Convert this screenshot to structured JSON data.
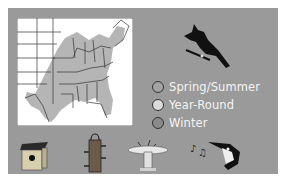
{
  "figure": {
    "map": {
      "name": "range-map",
      "region": "Eastern United States",
      "range_color": "#b5b5b5",
      "border_color": "#333333"
    },
    "bird": {
      "name": "cardinal-silhouette",
      "color": "#111111"
    },
    "legend": {
      "items": [
        {
          "label": "Spring/Summer",
          "color": "#a3a3a3"
        },
        {
          "label": "Year-Round",
          "color": "#dcdcdc"
        },
        {
          "label": "Winter",
          "color": "#8a8a8a"
        }
      ]
    },
    "habitat_icons": [
      {
        "name": "birdhouse-icon"
      },
      {
        "name": "tube-feeder-icon"
      },
      {
        "name": "birdbath-icon"
      },
      {
        "name": "singing-bird-icon"
      }
    ]
  },
  "colors": {
    "panel": "#9a9a9a",
    "background": "#ffffff",
    "legend_text": "#f4f4f4"
  }
}
